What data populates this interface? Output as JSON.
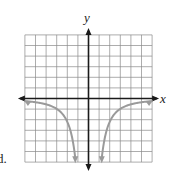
{
  "chart_data": {
    "type": "line",
    "title": "",
    "xlabel": "x",
    "ylabel": "y",
    "xlim": [
      -6,
      6
    ],
    "ylim": [
      -6,
      6
    ],
    "grid": true,
    "grid_step": 1,
    "legend": null,
    "function_description": "y = -k/x^2 (two branches, asymptotic to x-axis and y-axis, opening downward)",
    "series": [
      {
        "name": "left-branch",
        "x": [
          -6,
          -5,
          -4,
          -3,
          -2,
          -1.5,
          -1.25
        ],
        "y": [
          -0.25,
          -0.36,
          -0.56,
          -1.0,
          -2.25,
          -4.0,
          -5.6
        ]
      },
      {
        "name": "right-branch",
        "x": [
          1.25,
          1.5,
          2,
          3,
          4,
          5,
          6
        ],
        "y": [
          -5.6,
          -4.0,
          -2.25,
          -1.0,
          -0.56,
          -0.36,
          -0.25
        ]
      }
    ],
    "curve_color": "#9a9a9a",
    "axis_color": "#1a1a1a",
    "grid_color": "#8a8a8a"
  },
  "labels": {
    "x_axis": "x",
    "y_axis": "y",
    "choice": "d."
  }
}
